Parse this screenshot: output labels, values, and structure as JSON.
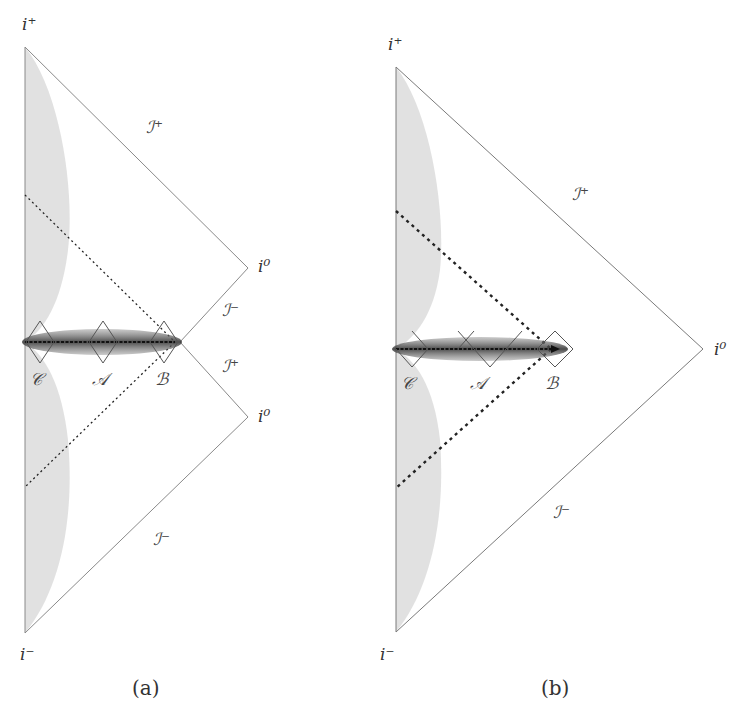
{
  "panels": [
    {
      "id": "a",
      "caption": "(a)",
      "labels": {
        "i_plus": "i⁺",
        "i_minus": "i⁻",
        "i0_upper": "i⁰",
        "i0_lower": "i⁰",
        "scri_plus_top": "ℐ⁺",
        "scri_minus_mid": "ℐ⁻",
        "scri_plus_mid": "ℐ⁺",
        "scri_minus_bottom": "ℐ⁻",
        "region_C": "𝒞",
        "region_A": "𝒜",
        "region_B": "ℬ"
      }
    },
    {
      "id": "b",
      "caption": "(b)",
      "labels": {
        "i_plus": "i⁺",
        "i_minus": "i⁻",
        "i0": "i⁰",
        "scri_plus": "ℐ⁺",
        "scri_minus": "ℐ⁻",
        "region_C": "𝒞",
        "region_A": "𝒜",
        "region_B": "ℬ"
      }
    }
  ],
  "colors": {
    "boundary": "#7a7a7a",
    "shade": "#d9d9d9",
    "tube": "#555555",
    "dotted": "#222222"
  }
}
